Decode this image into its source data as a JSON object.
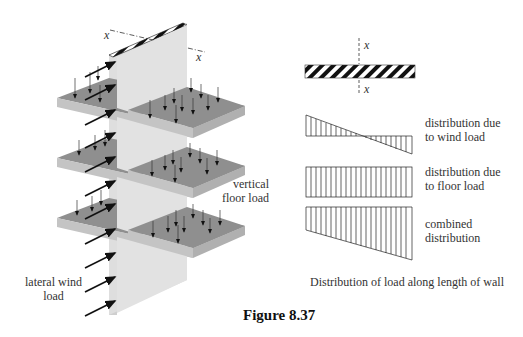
{
  "figure": {
    "title": "Figure 8.37",
    "caption": "Distribution of load along length of wall"
  },
  "left_diagram": {
    "axis_labels": [
      "x",
      "x"
    ],
    "labels": {
      "vertical_floor_load": [
        "vertical",
        "floor load"
      ],
      "lateral_wind_load": [
        "lateral wind",
        "load"
      ]
    },
    "colors": {
      "wall_front": "#dcdcdc",
      "wall_side": "#e8e8e8",
      "slab_top": "#8f8f8f",
      "slab_edge": "#c4c4c4",
      "arrow": "#111111"
    }
  },
  "right_diagram": {
    "section_axis_labels": [
      "x",
      "x"
    ],
    "distributions": [
      {
        "name": "wind",
        "label": [
          "distribution due",
          "to wind load"
        ]
      },
      {
        "name": "floor",
        "label": [
          "distribution due",
          "to floor load"
        ]
      },
      {
        "name": "combined",
        "label": [
          "combined",
          "distribution"
        ]
      }
    ]
  }
}
